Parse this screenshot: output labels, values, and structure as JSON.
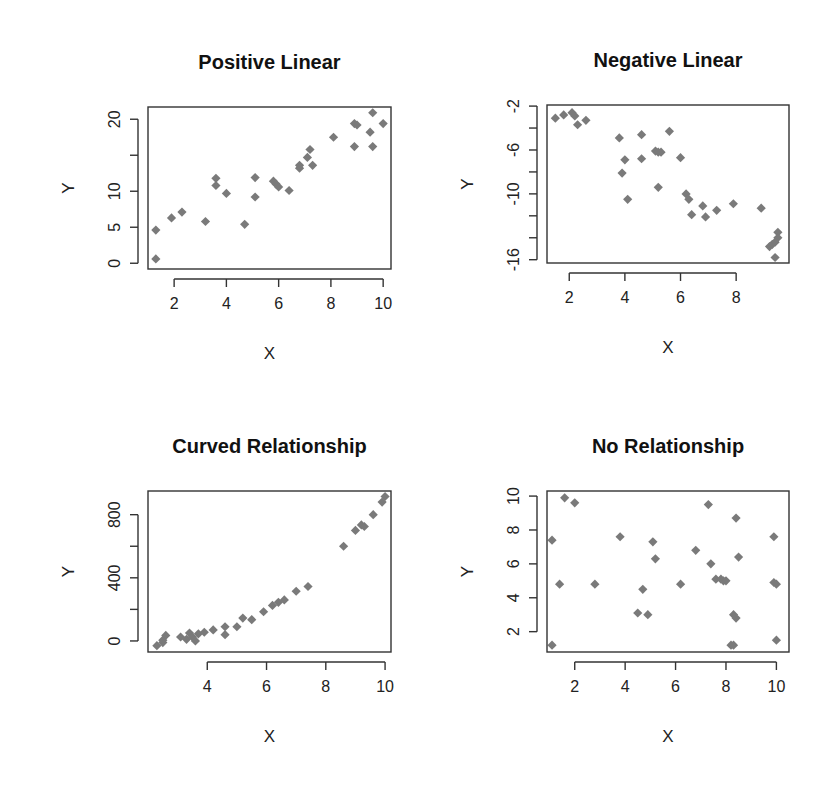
{
  "figure": {
    "layout": "2x2 grid of scatter plots",
    "marker": {
      "shape": "diamond",
      "color": "#7a7a7a"
    },
    "axis_color": "#333333"
  },
  "chart_data": [
    {
      "type": "scatter",
      "title": "Positive Linear",
      "xlabel": "X",
      "ylabel": "Y",
      "xlim": [
        1.0,
        10.3
      ],
      "ylim": [
        -0.8,
        21.7
      ],
      "xticks": [
        2,
        4,
        6,
        8,
        10
      ],
      "yticks": [
        0,
        5,
        10,
        15,
        20
      ],
      "ytick_labels": [
        "0",
        "5",
        "10",
        "",
        "20"
      ],
      "grid": false,
      "box": {
        "left": 148,
        "top": 107,
        "right": 391,
        "bottom": 269
      },
      "x": [
        1.3,
        1.3,
        1.9,
        2.3,
        3.2,
        3.6,
        3.6,
        4.0,
        4.7,
        5.1,
        5.1,
        5.8,
        5.9,
        6.0,
        6.4,
        6.8,
        6.8,
        7.1,
        7.2,
        7.3,
        8.1,
        8.9,
        9.0,
        8.9,
        9.6,
        9.5,
        9.6,
        10.0
      ],
      "y": [
        4.6,
        0.6,
        6.3,
        7.1,
        5.8,
        11.8,
        10.8,
        9.7,
        5.4,
        11.9,
        9.2,
        11.4,
        11.0,
        10.6,
        10.1,
        13.6,
        13.2,
        14.7,
        15.8,
        13.6,
        17.5,
        19.4,
        19.2,
        16.2,
        20.9,
        18.2,
        16.2,
        19.4
      ]
    },
    {
      "type": "scatter",
      "title": "Negative Linear",
      "xlabel": "X",
      "ylabel": "Y",
      "xlim": [
        1.2,
        9.9
      ],
      "ylim": [
        -16.3,
        -1.9
      ],
      "xticks": [
        2,
        4,
        6,
        8
      ],
      "yticks": [
        -2,
        -4,
        -6,
        -8,
        -10,
        -12,
        -14,
        -16
      ],
      "ytick_labels": [
        "-2",
        "",
        "-6",
        "",
        "-10",
        "",
        "",
        "-16"
      ],
      "grid": false,
      "box": {
        "left": 547,
        "top": 105,
        "right": 789,
        "bottom": 263
      },
      "x": [
        1.5,
        1.8,
        2.1,
        2.2,
        2.3,
        2.6,
        3.8,
        4.0,
        4.1,
        3.9,
        4.6,
        4.6,
        5.1,
        5.2,
        5.3,
        5.2,
        5.6,
        6.0,
        6.2,
        6.3,
        6.4,
        6.8,
        6.9,
        7.3,
        7.9,
        8.9,
        9.2,
        9.3,
        9.4,
        9.5,
        9.5,
        9.4
      ],
      "y": [
        -3.1,
        -2.8,
        -2.6,
        -2.9,
        -3.7,
        -3.3,
        -4.9,
        -6.9,
        -10.5,
        -8.1,
        -4.6,
        -6.8,
        -6.1,
        -6.2,
        -6.2,
        -9.4,
        -4.3,
        -6.7,
        -10.0,
        -10.5,
        -11.9,
        -11.1,
        -12.1,
        -11.5,
        -10.9,
        -11.3,
        -14.8,
        -14.6,
        -14.4,
        -13.5,
        -14.0,
        -15.8
      ]
    },
    {
      "type": "scatter",
      "title": "Curved Relationship",
      "xlabel": "X",
      "ylabel": "Y",
      "xlim": [
        2.0,
        10.2
      ],
      "ylim": [
        -70,
        950
      ],
      "xticks": [
        4,
        6,
        8,
        10
      ],
      "yticks": [
        0,
        200,
        400,
        600,
        800
      ],
      "ytick_labels": [
        "0",
        "",
        "400",
        "",
        "800"
      ],
      "grid": false,
      "box": {
        "left": 148,
        "top": 491,
        "right": 391,
        "bottom": 652
      },
      "x": [
        2.3,
        2.5,
        2.6,
        2.5,
        3.1,
        3.3,
        3.4,
        3.5,
        3.6,
        3.7,
        3.9,
        4.2,
        4.6,
        4.6,
        5.0,
        5.2,
        5.5,
        5.9,
        6.2,
        6.4,
        6.6,
        7.0,
        7.4,
        8.6,
        9.0,
        9.2,
        9.3,
        9.6,
        9.9,
        10.0
      ],
      "y": [
        -30,
        -10,
        35,
        5,
        25,
        10,
        50,
        25,
        0,
        45,
        55,
        70,
        90,
        40,
        90,
        145,
        135,
        185,
        225,
        245,
        260,
        315,
        345,
        600,
        700,
        735,
        725,
        800,
        880,
        915
      ]
    },
    {
      "type": "scatter",
      "title": "No Relationship",
      "xlabel": "X",
      "ylabel": "Y",
      "xlim": [
        0.9,
        10.5
      ],
      "ylim": [
        0.8,
        10.3
      ],
      "xticks": [
        2,
        4,
        6,
        8,
        10
      ],
      "yticks": [
        2,
        4,
        6,
        8,
        10
      ],
      "grid": false,
      "box": {
        "left": 547,
        "top": 491,
        "right": 789,
        "bottom": 652
      },
      "x": [
        1.1,
        1.1,
        1.4,
        1.6,
        2.0,
        2.8,
        3.8,
        4.5,
        4.7,
        4.9,
        5.1,
        5.2,
        6.2,
        6.8,
        7.3,
        7.4,
        7.6,
        7.8,
        7.9,
        8.0,
        8.2,
        8.3,
        8.3,
        8.4,
        8.5,
        8.4,
        9.9,
        10.0,
        9.9,
        10.0
      ],
      "y": [
        7.4,
        1.2,
        4.8,
        9.9,
        9.6,
        4.8,
        7.6,
        3.1,
        4.5,
        3.0,
        7.3,
        6.3,
        4.8,
        6.8,
        9.5,
        6.0,
        5.1,
        5.1,
        5.0,
        5.0,
        1.2,
        3.0,
        1.2,
        2.8,
        6.4,
        8.7,
        7.6,
        4.8,
        4.9,
        1.5
      ]
    }
  ]
}
